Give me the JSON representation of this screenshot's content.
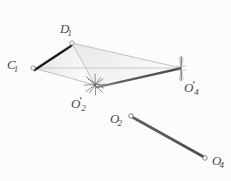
{
  "figure": {
    "background_color": "#fcfcfc",
    "width": 231,
    "height": 181,
    "labels": {
      "c1": {
        "base": "C",
        "sub": "1",
        "prime": ""
      },
      "d1": {
        "base": "D",
        "sub": "1",
        "prime": ""
      },
      "o2p": {
        "base": "O",
        "sub": "2",
        "prime": "′"
      },
      "o4p": {
        "base": "O",
        "sub": "4",
        "prime": "′"
      },
      "o2": {
        "base": "O",
        "sub": "2",
        "prime": ""
      },
      "o4": {
        "base": "O",
        "sub": "4",
        "prime": ""
      }
    },
    "points": [
      {
        "id": "c1",
        "x": 33,
        "y": 68,
        "marker": "open-circle"
      },
      {
        "id": "d1",
        "x": 72,
        "y": 43,
        "marker": "open-circle"
      },
      {
        "id": "o2p",
        "x": 95,
        "y": 85,
        "marker": "starburst"
      },
      {
        "id": "o4p",
        "x": 181,
        "y": 68,
        "marker": "vertical-tick"
      },
      {
        "id": "o2",
        "x": 131,
        "y": 116,
        "marker": "open-circle"
      },
      {
        "id": "o4",
        "x": 205,
        "y": 158,
        "marker": "open-circle"
      }
    ],
    "edges": [
      {
        "id": "c1-d1",
        "from": "c1",
        "to": "d1",
        "style": "thick-black"
      },
      {
        "id": "o2p-o4p",
        "from": "o2p",
        "to": "o4p",
        "style": "thick-gray"
      },
      {
        "id": "d1-o4p",
        "from": "d1",
        "to": "o4p",
        "style": "thin-gray"
      },
      {
        "id": "c1-o2p",
        "from": "c1",
        "to": "o2p",
        "style": "thin-gray"
      },
      {
        "id": "d1-o2p",
        "from": "d1",
        "to": "o2p",
        "style": "thin-gray"
      },
      {
        "id": "c1-o4p",
        "from": "c1",
        "to": "o4p",
        "style": "thin-gray"
      },
      {
        "id": "o2-o4",
        "from": "o2",
        "to": "o4",
        "style": "medium-gray"
      }
    ],
    "colors": {
      "thick_black": "#111111",
      "thick_gray": "#6e6e6e",
      "thin_gray": "#b4b4b4",
      "medium_gray": "#585858",
      "fill_light": "#ececec",
      "fill_lighter": "#f6f6f6",
      "marker_stroke": "#8c8c8c",
      "label_text": "#4a4a4a"
    }
  }
}
